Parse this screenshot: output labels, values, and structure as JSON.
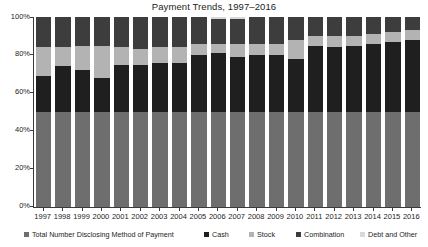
{
  "chart_data": {
    "type": "bar",
    "subtype": "stacked-percent-column",
    "title": "Payment Trends, 1997–2016",
    "xlabel": "",
    "ylabel": "",
    "ylim": [
      0,
      100
    ],
    "ytick_labels": [
      "0%",
      "20%",
      "40%",
      "60%",
      "80%",
      "100%"
    ],
    "ytick_values": [
      0,
      20,
      40,
      60,
      80,
      100
    ],
    "grid": false,
    "legend_position": "bottom",
    "categories": [
      "1997",
      "1998",
      "1999",
      "2000",
      "2001",
      "2002",
      "2003",
      "2004",
      "2005",
      "2006",
      "2007",
      "2008",
      "2009",
      "2010",
      "2011",
      "2012",
      "2013",
      "2014",
      "2015",
      "2016"
    ],
    "series": [
      {
        "name": "Total Number Disclosing Method of Payment",
        "color": "#6e6e6e",
        "values": [
          50,
          50,
          50,
          50,
          50,
          50,
          50,
          50,
          50,
          50,
          50,
          50,
          50,
          50,
          50,
          50,
          50,
          50,
          50,
          50
        ]
      },
      {
        "name": "Cash",
        "color": "#1f1f1f",
        "values": [
          19,
          24,
          22,
          18,
          25,
          25,
          26,
          26,
          30,
          31,
          29,
          30,
          30,
          28,
          35,
          34,
          35,
          36,
          37,
          38
        ]
      },
      {
        "name": "Stock",
        "color": "#b3b3b3",
        "values": [
          15,
          10,
          13,
          17,
          9,
          8,
          8,
          8,
          6,
          5,
          7,
          6,
          6,
          10,
          5,
          6,
          5,
          5,
          5,
          5
        ]
      },
      {
        "name": "Combination",
        "color": "#3d3d3d",
        "values": [
          16,
          16,
          15,
          15,
          16,
          17,
          16,
          16,
          14,
          13,
          13,
          14,
          14,
          12,
          10,
          10,
          10,
          9,
          8,
          7
        ]
      },
      {
        "name": "Debt and Other",
        "color": "#d9d9d9",
        "values": [
          0,
          0,
          0,
          0,
          0,
          0,
          0,
          0,
          0,
          1,
          1,
          0,
          0,
          0,
          0,
          0,
          0,
          0,
          0,
          0
        ]
      }
    ]
  },
  "legend": {
    "items": [
      {
        "label": "Total Number Disclosing Method of Payment",
        "color": "#6e6e6e",
        "x": 24
      },
      {
        "label": "Cash",
        "color": "#1f1f1f",
        "x": 204
      },
      {
        "label": "Stock",
        "color": "#b3b3b3",
        "x": 249
      },
      {
        "label": "Combination",
        "color": "#3d3d3d",
        "x": 296
      },
      {
        "label": "Debt and Other",
        "color": "#d9d9d9",
        "x": 360
      }
    ]
  },
  "axes": {
    "y_labels": [
      "100%",
      "80%",
      "60%",
      "40%",
      "20%",
      "0%"
    ],
    "y_positions": [
      13,
      50,
      88,
      126,
      164,
      202
    ]
  }
}
